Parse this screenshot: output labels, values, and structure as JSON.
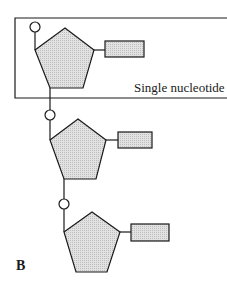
{
  "diagram": {
    "type": "dna-strand-nucleotides",
    "panel_label": "B",
    "box_label": "Single nucleotide",
    "nucleotides": [
      {
        "index": 1,
        "in_box": true,
        "components": [
          "phosphate",
          "sugar",
          "base"
        ]
      },
      {
        "index": 2,
        "in_box": false,
        "components": [
          "phosphate",
          "sugar",
          "base"
        ]
      },
      {
        "index": 3,
        "in_box": false,
        "components": [
          "phosphate",
          "sugar",
          "base"
        ]
      }
    ],
    "colors": {
      "stroke": "#1a1a1a",
      "fill": "#d8d8d8",
      "background": "#ffffff"
    }
  }
}
